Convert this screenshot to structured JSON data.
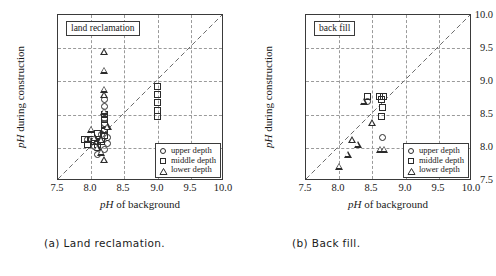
{
  "figure": {
    "axis": {
      "xlabel_italic": "pH",
      "xlabel_rest": " of background",
      "ylabel_italic": "pH",
      "ylabel_rest": " during construction",
      "xticks": [
        "7.5",
        "8.0",
        "8.5",
        "9.0",
        "9.5",
        "10.0"
      ],
      "yticks": [
        "7.5",
        "8.0",
        "8.5",
        "9.0",
        "9.5",
        "10.0"
      ],
      "xlim": [
        7.5,
        10.0
      ],
      "ylim": [
        7.5,
        10.0
      ]
    },
    "legend": {
      "upper": "upper depth",
      "middle": "middle depth",
      "lower": "lower depth",
      "upper_marker": "circle-marker",
      "middle_marker": "square-marker",
      "lower_marker": "triangle-marker"
    },
    "panels": [
      {
        "title": "land reclamation",
        "caption": "(a) Land reclamation."
      },
      {
        "title": "back fill",
        "caption": "(b) Back fill."
      }
    ]
  },
  "chart_data": [
    {
      "type": "scatter",
      "title": "land reclamation",
      "caption": "(a) Land reclamation.",
      "xlabel": "pH of background",
      "ylabel": "pH during construction",
      "xlim": [
        7.5,
        10.0
      ],
      "ylim": [
        7.5,
        10.0
      ],
      "xticks": [
        7.5,
        8.0,
        8.5,
        9.0,
        9.5,
        10.0
      ],
      "yticks": [
        7.5,
        8.0,
        8.5,
        9.0,
        9.5,
        10.0
      ],
      "grid": true,
      "reference_line": {
        "type": "diagonal",
        "style": "dashed",
        "from": [
          7.5,
          7.5
        ],
        "to": [
          10.0,
          10.0
        ]
      },
      "legend_position": "lower right",
      "series": [
        {
          "name": "upper depth",
          "marker": "circle",
          "points": [
            [
              8.2,
              8.72
            ],
            [
              8.2,
              8.62
            ],
            [
              8.2,
              8.44
            ],
            [
              8.2,
              8.36
            ],
            [
              8.2,
              8.28
            ],
            [
              8.25,
              8.15
            ],
            [
              8.25,
              8.06
            ],
            [
              8.2,
              7.98
            ],
            [
              8.1,
              8.1
            ],
            [
              8.15,
              8.2
            ],
            [
              7.95,
              8.12
            ],
            [
              8.1,
              7.9
            ],
            [
              8.05,
              8.02
            ]
          ]
        },
        {
          "name": "middle depth",
          "marker": "square",
          "points": [
            [
              8.2,
              8.5
            ],
            [
              8.2,
              8.42
            ],
            [
              8.2,
              8.34
            ],
            [
              8.2,
              8.26
            ],
            [
              8.2,
              8.18
            ],
            [
              8.1,
              8.22
            ],
            [
              8.0,
              8.12
            ],
            [
              7.9,
              8.12
            ],
            [
              7.95,
              8.05
            ],
            [
              8.05,
              8.1
            ],
            [
              8.1,
              8.05
            ],
            [
              9.0,
              8.92
            ],
            [
              9.0,
              8.8
            ],
            [
              9.0,
              8.68
            ],
            [
              9.0,
              8.56
            ],
            [
              9.0,
              8.47
            ],
            [
              8.15,
              8.1
            ]
          ]
        },
        {
          "name": "lower depth",
          "marker": "triangle",
          "points": [
            [
              8.2,
              9.45
            ],
            [
              8.2,
              9.17
            ],
            [
              8.2,
              8.88
            ],
            [
              8.2,
              8.8
            ],
            [
              8.2,
              8.55
            ],
            [
              8.0,
              8.28
            ],
            [
              8.15,
              8.12
            ],
            [
              8.1,
              8.0
            ],
            [
              8.15,
              7.93
            ],
            [
              8.2,
              7.82
            ],
            [
              8.05,
              8.15
            ],
            [
              8.25,
              8.32
            ]
          ]
        }
      ]
    },
    {
      "type": "scatter",
      "title": "back fill",
      "caption": "(b) Back fill.",
      "xlabel": "pH of background",
      "ylabel": "pH during construction",
      "xlim": [
        7.5,
        10.0
      ],
      "ylim": [
        7.5,
        10.0
      ],
      "xticks": [
        7.5,
        8.0,
        8.5,
        9.0,
        9.5,
        10.0
      ],
      "yticks": [
        7.5,
        8.0,
        8.5,
        9.0,
        9.5,
        10.0
      ],
      "grid": true,
      "reference_line": {
        "type": "diagonal",
        "style": "dashed",
        "from": [
          7.5,
          7.5
        ],
        "to": [
          10.0,
          10.0
        ]
      },
      "legend_position": "lower right",
      "series": [
        {
          "name": "upper depth",
          "marker": "circle",
          "points": [
            [
              8.42,
              8.7
            ],
            [
              8.65,
              8.15
            ]
          ]
        },
        {
          "name": "middle depth",
          "marker": "square",
          "points": [
            [
              8.42,
              8.78
            ],
            [
              8.6,
              8.78
            ],
            [
              8.67,
              8.78
            ],
            [
              8.63,
              8.72
            ],
            [
              8.65,
              8.6
            ],
            [
              8.63,
              8.47
            ]
          ]
        },
        {
          "name": "lower depth",
          "marker": "triangle",
          "points": [
            [
              8.37,
              8.7
            ],
            [
              8.5,
              8.38
            ],
            [
              8.2,
              8.12
            ],
            [
              8.28,
              8.05
            ],
            [
              8.13,
              7.9
            ],
            [
              8.62,
              7.98
            ],
            [
              8.68,
              7.98
            ],
            [
              8.0,
              7.72
            ]
          ]
        }
      ]
    }
  ]
}
